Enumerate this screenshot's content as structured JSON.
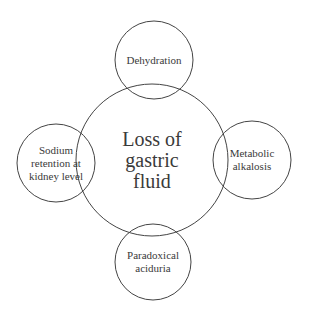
{
  "diagram": {
    "colors": {
      "stroke": "#444444",
      "text": "#3a3a3a",
      "background": "#ffffff"
    },
    "center": {
      "label": "Loss of\ngastric\nfluid",
      "cx": 152,
      "cy": 160,
      "r": 76
    },
    "satellites": [
      {
        "id": "top",
        "label": "Dehydration",
        "cx": 154,
        "cy": 60,
        "r": 39
      },
      {
        "id": "left",
        "label": "Sodium\nretention at\nkidney level",
        "cx": 56,
        "cy": 163,
        "r": 39
      },
      {
        "id": "right",
        "label": "Metabolic\nalkalosis",
        "cx": 252,
        "cy": 160,
        "r": 39
      },
      {
        "id": "bottom",
        "label": "Paradoxical\naciduria",
        "cx": 153,
        "cy": 262,
        "r": 38
      }
    ]
  }
}
